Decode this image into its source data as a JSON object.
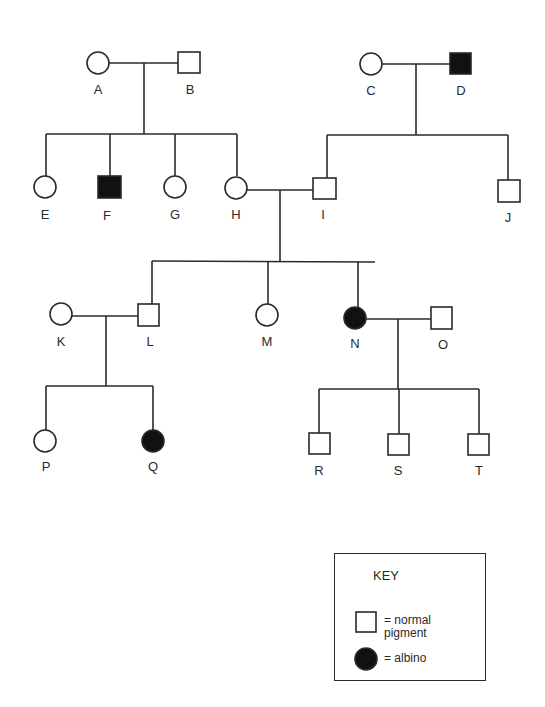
{
  "individuals": [
    {
      "id": "A",
      "sex": "female",
      "affected": false
    },
    {
      "id": "B",
      "sex": "male",
      "affected": false
    },
    {
      "id": "C",
      "sex": "female",
      "affected": false
    },
    {
      "id": "D",
      "sex": "male",
      "affected": true
    },
    {
      "id": "E",
      "sex": "female",
      "affected": false
    },
    {
      "id": "F",
      "sex": "male",
      "affected": true
    },
    {
      "id": "G",
      "sex": "female",
      "affected": false
    },
    {
      "id": "H",
      "sex": "female",
      "affected": false
    },
    {
      "id": "I",
      "sex": "male",
      "affected": false
    },
    {
      "id": "J",
      "sex": "male",
      "affected": false
    },
    {
      "id": "K",
      "sex": "female",
      "affected": false
    },
    {
      "id": "L",
      "sex": "male",
      "affected": false
    },
    {
      "id": "M",
      "sex": "female",
      "affected": false
    },
    {
      "id": "N",
      "sex": "female",
      "affected": true
    },
    {
      "id": "O",
      "sex": "male",
      "affected": false
    },
    {
      "id": "P",
      "sex": "female",
      "affected": false
    },
    {
      "id": "Q",
      "sex": "female",
      "affected": true
    },
    {
      "id": "R",
      "sex": "male",
      "affected": false
    },
    {
      "id": "S",
      "sex": "male",
      "affected": false
    },
    {
      "id": "T",
      "sex": "male",
      "affected": false
    }
  ],
  "labels": {
    "A": "A",
    "B": "B",
    "C": "C",
    "D": "D",
    "E": "E",
    "F": "F",
    "G": "G",
    "H": "H",
    "I": "I",
    "J": "J",
    "K": "K",
    "L": "L",
    "M": "M",
    "N": "N",
    "O": "O",
    "P": "P",
    "Q": "Q",
    "R": "R",
    "S": "S",
    "T": "T"
  },
  "couples": [
    {
      "partners": [
        "A",
        "B"
      ],
      "children": [
        "E",
        "F",
        "G",
        "H"
      ]
    },
    {
      "partners": [
        "C",
        "D"
      ],
      "children": [
        "I",
        "J"
      ]
    },
    {
      "partners": [
        "H",
        "I"
      ],
      "children": [
        "L",
        "M",
        "N"
      ]
    },
    {
      "partners": [
        "K",
        "L"
      ],
      "children": [
        "P",
        "Q"
      ]
    },
    {
      "partners": [
        "N",
        "O"
      ],
      "children": [
        "R",
        "S",
        "T"
      ]
    }
  ],
  "key": {
    "title": "KEY",
    "normal_line1": "= normal",
    "normal_line2": "pigment",
    "albino": "= albino"
  }
}
